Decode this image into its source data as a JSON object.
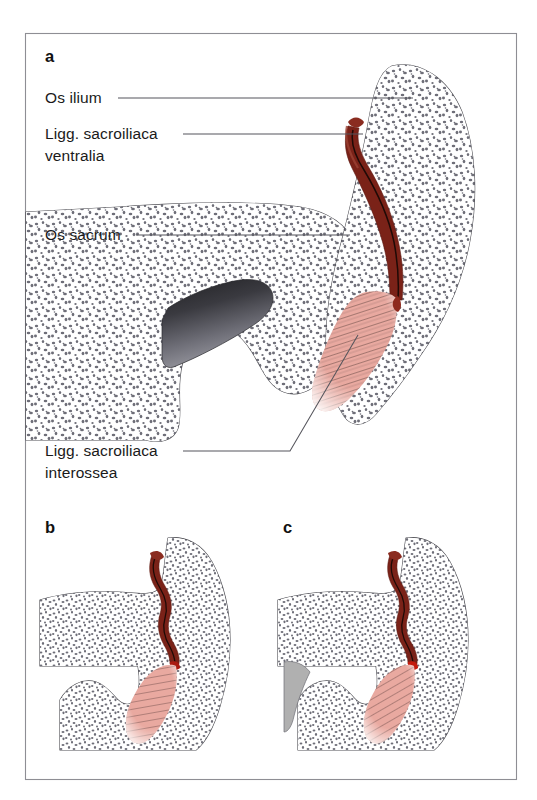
{
  "figure": {
    "frame": {
      "x": 25,
      "y": 33,
      "width": 492,
      "height": 747,
      "border_color": "#8e8e94"
    },
    "background_color": "#ffffff"
  },
  "panels": [
    {
      "id": "a",
      "letter": "a",
      "letter_x": 45,
      "letter_y": 62
    },
    {
      "id": "b",
      "letter": "b",
      "letter_x": 45,
      "letter_y": 533
    },
    {
      "id": "c",
      "letter": "c",
      "letter_x": 283,
      "letter_y": 533
    }
  ],
  "labels": [
    {
      "id": "os-ilium",
      "name": "os-ilium-label",
      "lines": [
        "Os ilium"
      ],
      "x": 45,
      "y": 103,
      "leader": "M 118 98 L 413 98",
      "leader_type": "straight"
    },
    {
      "id": "ligg-sacroiliaca-ventralia",
      "name": "ligg-sacroiliaca-ventralia-label",
      "lines": [
        "Ligg. sacroiliaca",
        "ventralia"
      ],
      "x": 45,
      "y": 139,
      "leader": "M 183 134 L 363 134",
      "leader_type": "straight"
    },
    {
      "id": "os-sacrum",
      "name": "os-sacrum-label",
      "lines": [
        "Os sacrum"
      ],
      "x": 45,
      "y": 240,
      "leader": "M 136 235 L 350 235",
      "leader_type": "straight"
    },
    {
      "id": "ligg-sacroiliaca-interossea",
      "name": "ligg-sacroiliaca-interossea-label",
      "lines": [
        "Ligg. sacroiliaca",
        "interossea"
      ],
      "x": 45,
      "y": 456,
      "leader": "M 183 451 L 290 451 L 358 335",
      "leader_type": "bent"
    }
  ],
  "colors": {
    "bone_outline": "#4c4c52",
    "bone_fill": "#ffffff",
    "stipple": "#6e6e78",
    "ligament_ventral": "#7a2218",
    "ligament_ventral_core": "#2b0d08",
    "ligament_ventral_light": "#9c4234",
    "ligament_interosseous": "#e9a9a0",
    "ligament_interosseous_fiber": "#6b4a46",
    "sacral_canal_dark": "#2e2e32",
    "sacral_canal_light": "#8a8a90",
    "wedge_gray": "#b0b0b0",
    "leader_line": "#55555c",
    "text": "#1a1a1a"
  },
  "structures": {
    "panel_a": {
      "ilium_name": "Os ilium",
      "sacrum_name": "Os sacrum",
      "ventral_ligament_name": "Ligg. sacroiliaca ventralia",
      "interosseous_ligament_name": "Ligg. sacroiliaca interossea",
      "sacral_canal_name": "sacral canal"
    },
    "panel_b": {
      "note": "mid-level section, no gray canal"
    },
    "panel_c": {
      "note": "lower-level section with gray wedge"
    }
  }
}
